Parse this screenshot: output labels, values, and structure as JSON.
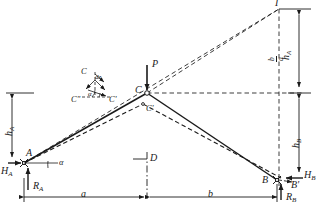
{
  "figure": {
    "type": "structural-mechanics-diagram",
    "colors": {
      "line": "#1a1a1a",
      "background": "#ffffff"
    }
  },
  "labels": {
    "apex_C": "C",
    "apex_C_prime": "C'",
    "load_P": "P",
    "support_A": "A",
    "support_B": "B",
    "support_B_prime": "B'",
    "reaction_HA": "H",
    "reaction_HA_sub": "A",
    "reaction_RA": "R",
    "reaction_RA_sub": "A",
    "reaction_HB": "H",
    "reaction_HB_sub": "B",
    "reaction_RB": "R",
    "reaction_RB_sub": "B",
    "height_hA": "h",
    "height_hA_sub": "A",
    "height_hB": "h",
    "height_hB_sub": "B",
    "span_a": "a",
    "span_b": "b",
    "pole_I": "I",
    "center_D": "D",
    "angle_alpha": "α",
    "delta_z": "dz"
  },
  "top_right_dimension": {
    "numerator": "b",
    "denominator": "a",
    "factor": "h",
    "factor_sub": "A",
    "full": "b/a · h_A"
  },
  "detail_inset": {
    "title_point": "C",
    "point_double_prime": "C\"",
    "point_prime": "C'",
    "angle": "α",
    "displacement": "dz"
  },
  "geometry": {
    "A": [
      24,
      163
    ],
    "C": [
      147,
      93
    ],
    "B": [
      277,
      180
    ],
    "I": [
      279,
      9
    ],
    "apex_level_y": 93,
    "base_level_y": 180,
    "left_dim_x": 12,
    "right_dim_x": 303,
    "bottom_dim_y": 197,
    "center_x": 147
  }
}
